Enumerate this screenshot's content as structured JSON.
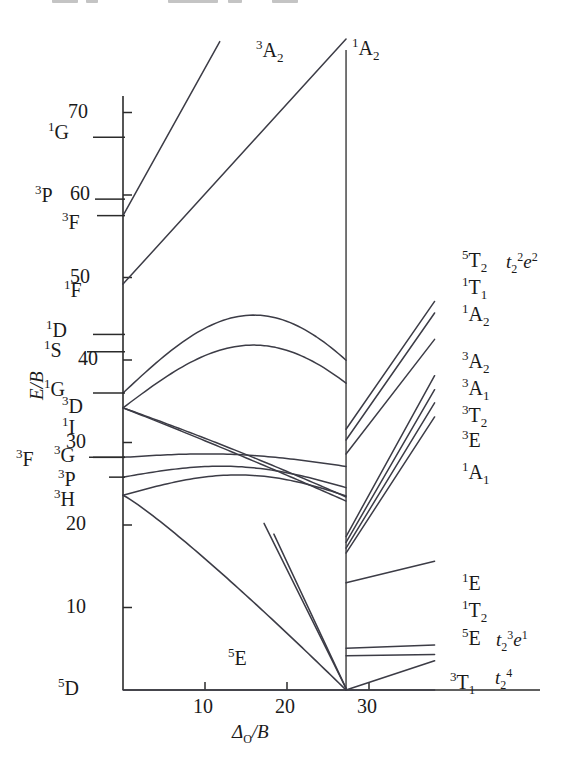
{
  "figure": {
    "type": "tanabe-sugano-diagram",
    "configuration": "d6",
    "axis": {
      "y_label": "E/B",
      "x_label_main": "Δ",
      "x_label_sub": "O",
      "x_label_tail": "/B",
      "x_ticks": [
        {
          "value": 10,
          "label": "10"
        },
        {
          "value": 20,
          "label": "20"
        },
        {
          "value": 30,
          "label": "30"
        }
      ],
      "y_ticks": [
        {
          "value": 70,
          "label": "70"
        },
        {
          "value": 60,
          "label": "60"
        },
        {
          "value": 50,
          "label": "50"
        },
        {
          "value": 40,
          "label": "40"
        },
        {
          "value": 30,
          "label": "30"
        },
        {
          "value": 20,
          "label": "20"
        },
        {
          "value": 10,
          "label": "10"
        }
      ],
      "xlim": [
        0,
        38
      ],
      "ylim": [
        0,
        78
      ],
      "crossover_x": 27.2
    }
  },
  "free_ion_terms": [
    {
      "id": "1G-high",
      "sup": "1",
      "letter": "G",
      "energy": 67.0
    },
    {
      "id": "3P",
      "sup": "3",
      "letter": "P",
      "energy": 59.5
    },
    {
      "id": "3F",
      "sup": "3",
      "letter": "F",
      "energy": 57.5
    },
    {
      "id": "1F",
      "sup": "1",
      "letter": "F",
      "energy": 49.2
    },
    {
      "id": "1D",
      "sup": "1",
      "letter": "D",
      "energy": 43.1
    },
    {
      "id": "1S",
      "sup": "1",
      "letter": "S",
      "energy": 41.0
    },
    {
      "id": "1G-low",
      "sup": "1",
      "letter": "G",
      "energy": 36.0
    },
    {
      "id": "3D",
      "sup": "3",
      "letter": "D",
      "energy": 34.2
    },
    {
      "id": "1I",
      "sup": "1",
      "letter": "I",
      "energy": 32.4
    },
    {
      "id": "3F-low",
      "sup": "3",
      "letter": "F",
      "energy": 28.0
    },
    {
      "id": "3G",
      "sup": "3",
      "letter": "G",
      "energy": 28.2
    },
    {
      "id": "3P-low",
      "sup": "3",
      "letter": "P",
      "energy": 25.8
    },
    {
      "id": "3H",
      "sup": "3",
      "letter": "H",
      "energy": 23.6
    },
    {
      "id": "5D",
      "sup": "5",
      "letter": "D",
      "energy": 0.0
    }
  ],
  "curve_labels": {
    "top_left": {
      "sup": "3",
      "letter": "A",
      "sub": "2"
    },
    "top_right": {
      "sup": "1",
      "letter": "A",
      "sub": "2"
    },
    "ground_low": {
      "sup": "5",
      "letter": "E",
      "sub": ""
    },
    "ground_high": {
      "sup": "3",
      "letter": "T",
      "sub": "1"
    },
    "ground_high_cfg": {
      "base": "t",
      "base_sub": "2",
      "base_sup": "4"
    }
  },
  "right_labels": [
    {
      "id": "5T2",
      "sup": "5",
      "letter": "T",
      "sub": "2",
      "cfg": {
        "a": "t",
        "a_sub": "2",
        "a_sup": "2",
        "b": "e",
        "b_sup": "2"
      },
      "y": 250
    },
    {
      "id": "1T1",
      "sup": "1",
      "letter": "T",
      "sub": "1",
      "cfg": null,
      "y": 277
    },
    {
      "id": "1A2",
      "sup": "1",
      "letter": "A",
      "sub": "2",
      "cfg": null,
      "y": 304
    },
    {
      "id": "3A2",
      "sup": "3",
      "letter": "A",
      "sub": "2",
      "cfg": null,
      "y": 351
    },
    {
      "id": "3A1",
      "sup": "3",
      "letter": "A",
      "sub": "1",
      "cfg": null,
      "y": 378
    },
    {
      "id": "3T2",
      "sup": "3",
      "letter": "T",
      "sub": "2",
      "cfg": null,
      "y": 405
    },
    {
      "id": "3E",
      "sup": "3",
      "letter": "E",
      "sub": "",
      "cfg": null,
      "y": 430
    },
    {
      "id": "1A1",
      "sup": "1",
      "letter": "A",
      "sub": "1",
      "cfg": null,
      "y": 462
    },
    {
      "id": "1E",
      "sup": "1",
      "letter": "E",
      "sub": "",
      "cfg": null,
      "y": 573
    },
    {
      "id": "1T2",
      "sup": "1",
      "letter": "T",
      "sub": "2",
      "cfg": null,
      "y": 600
    },
    {
      "id": "5E",
      "sup": "5",
      "letter": "E",
      "sub": "",
      "cfg": {
        "a": "t",
        "a_sub": "2",
        "a_sup": "3",
        "b": "e",
        "b_sup": "1"
      },
      "y": 628
    }
  ],
  "colors": {
    "line": "#3c3c46",
    "axis": "#2b2b2b",
    "text": "#141414",
    "background": "#ffffff"
  }
}
